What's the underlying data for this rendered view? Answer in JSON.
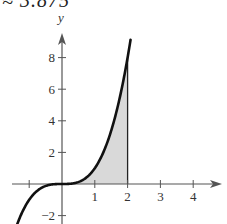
{
  "header": {
    "text": "≈ 3.875"
  },
  "chart_data": {
    "type": "area",
    "title": "",
    "function": "y = x^3",
    "xlabel": "",
    "ylabel": "y",
    "xlim": [
      -1.5,
      4.8
    ],
    "ylim": [
      -2.8,
      9.5
    ],
    "x_ticks": [
      -1,
      1,
      2,
      3,
      4
    ],
    "x_tick_labels": [
      "",
      "1",
      "2",
      "3",
      "4"
    ],
    "y_ticks": [
      -2,
      2,
      4,
      6,
      8
    ],
    "y_tick_labels": [
      "−2",
      "2",
      "4",
      "6",
      "8"
    ],
    "shaded_region": {
      "from_x": 0,
      "to_x": 2,
      "under": "y = x^3",
      "color": "#d9d9d9"
    },
    "curve_points": [
      {
        "x": -1.4,
        "y": -2.744
      },
      {
        "x": -1.0,
        "y": -1.0
      },
      {
        "x": -0.5,
        "y": -0.125
      },
      {
        "x": 0,
        "y": 0
      },
      {
        "x": 0.5,
        "y": 0.125
      },
      {
        "x": 1.0,
        "y": 1.0
      },
      {
        "x": 1.5,
        "y": 3.375
      },
      {
        "x": 2.0,
        "y": 8.0
      },
      {
        "x": 2.1,
        "y": 9.261
      }
    ],
    "grid": false,
    "colors": {
      "curve": "#111111",
      "axis": "#555555",
      "fill": "#d9d9d9"
    }
  }
}
